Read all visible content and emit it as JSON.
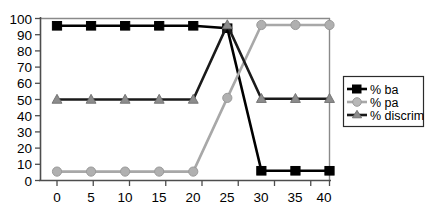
{
  "chart_data": {
    "type": "line",
    "title": "",
    "xlabel": "",
    "ylabel": "",
    "x": [
      0,
      5,
      10,
      15,
      20,
      25,
      30,
      35,
      40
    ],
    "xlim": [
      0,
      40
    ],
    "ylim": [
      0,
      100
    ],
    "xticks": [
      "0",
      "5",
      "10",
      "15",
      "20",
      "25",
      "30",
      "35",
      "40"
    ],
    "yticks": [
      "0",
      "10",
      "20",
      "30",
      "40",
      "50",
      "60",
      "70",
      "80",
      "90",
      "100"
    ],
    "grid": false,
    "legend_position": "right",
    "series": [
      {
        "name": "% ba",
        "values": [
          95.5,
          95.5,
          95.5,
          95.5,
          95.5,
          94.0,
          6.0,
          6.0,
          6.0
        ],
        "color": "#000000",
        "marker": "square",
        "marker_color": "#000000"
      },
      {
        "name": "% pa",
        "values": [
          5.5,
          5.5,
          5.5,
          5.5,
          5.5,
          51.0,
          96.0,
          96.0,
          96.0
        ],
        "color": "#a8a8a8",
        "marker": "circle",
        "marker_color": "#b0b0b0"
      },
      {
        "name": "% discrim",
        "values": [
          50.0,
          50.0,
          50.0,
          50.0,
          50.0,
          96.0,
          50.5,
          50.5,
          50.5
        ],
        "color": "#1a1a1a",
        "marker": "triangle",
        "marker_color": "#8c8c8c"
      }
    ]
  },
  "legend": {
    "items": [
      {
        "label": "% ba"
      },
      {
        "label": "% pa"
      },
      {
        "label": "% discrim"
      }
    ]
  },
  "axes": {
    "y_tick_labels": [
      "100",
      "90",
      "80",
      "70",
      "60",
      "50",
      "40",
      "30",
      "20",
      "10",
      "0"
    ],
    "x_tick_labels": [
      "0",
      "5",
      "10",
      "15",
      "20",
      "25",
      "30",
      "35",
      "40"
    ]
  },
  "colors": {
    "axis": "#4d4d4d",
    "plot_border": "#7a7a7a",
    "background": "#ffffff",
    "series_ba": "#000000",
    "series_pa": "#a8a8a8",
    "series_discrim": "#1a1a1a"
  }
}
